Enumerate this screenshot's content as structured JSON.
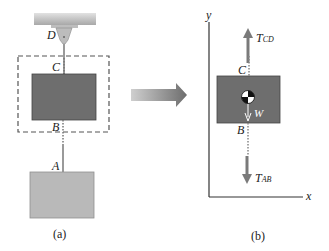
{
  "figure_a": {
    "caption": "(a)",
    "labels": {
      "D": "D",
      "C": "C",
      "B": "B",
      "A": "A"
    }
  },
  "figure_b": {
    "caption": "(b)",
    "axes": {
      "x": "x",
      "y": "y"
    },
    "labels": {
      "C": "C",
      "B": "B"
    },
    "forces": {
      "tcd_main": "T",
      "tcd_sub": "CD",
      "tab_main": "T",
      "tab_sub": "AB",
      "weight": "W"
    }
  },
  "colors": {
    "ceiling": "#c8c8c8",
    "block_dark": "#6e6e6e",
    "block_light": "#b9b9b9",
    "arrow": "#7a7a7a",
    "dashed": "#555555"
  }
}
